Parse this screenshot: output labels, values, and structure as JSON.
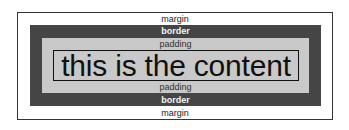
{
  "diagram": {
    "type": "css-box-model",
    "layers": {
      "margin": {
        "label_top": "margin",
        "label_bottom": "margin",
        "color": "#ffffff"
      },
      "border": {
        "label_top": "border",
        "label_bottom": "border",
        "color": "#454545"
      },
      "padding": {
        "label_top": "padding",
        "label_bottom": "padding",
        "color": "#c9c9c9"
      },
      "content": {
        "text": "this is the content"
      }
    }
  }
}
